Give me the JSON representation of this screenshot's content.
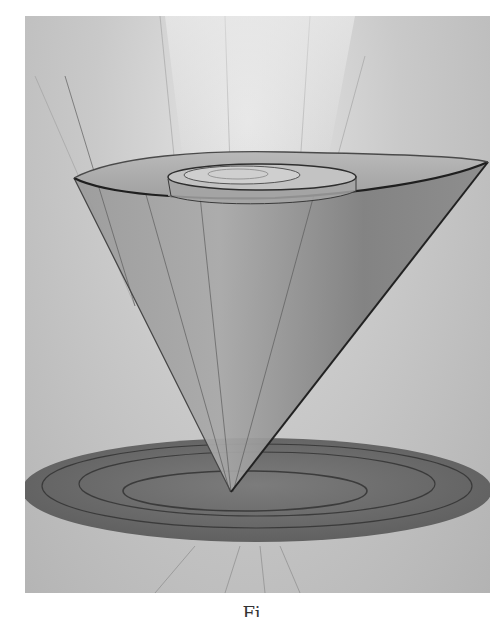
{
  "figure": {
    "caption": "Fi",
    "colors": {
      "background_light": "#e6e6e6",
      "background_mid": "#c2c2c2",
      "cone_body": "#8f8f8f",
      "disc": "#6e6e6e",
      "outline": "#2b2b2b"
    }
  }
}
